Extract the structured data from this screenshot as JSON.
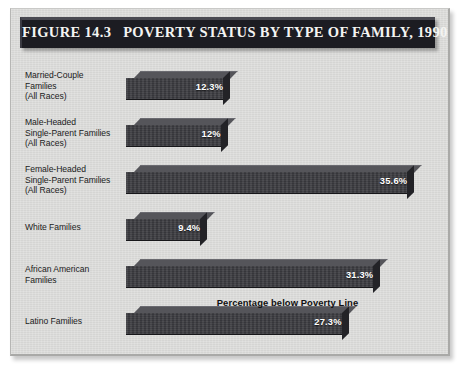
{
  "figure": {
    "title": "FIGURE 14.3   POVERTY STATUS BY TYPE OF FAMILY, 1990",
    "axis_caption": "Percentage below Poverty Line",
    "frame_background": "#d9d9d7",
    "title_band_color": "#1c1c22",
    "bar_front_color": "#3c3c41",
    "bar_top_color": "#55555a",
    "bar_side_color": "#232327",
    "value_label_color": "#ffffff"
  },
  "chart_data": {
    "type": "bar",
    "orientation": "horizontal",
    "title": "FIGURE 14.3   POVERTY STATUS BY TYPE OF FAMILY, 1990",
    "xlabel": "Percentage below Poverty Line",
    "ylabel": "",
    "xlim": [
      0,
      40
    ],
    "grid": false,
    "legend": "none",
    "categories": [
      "Married-Couple Families (All Races)",
      "Male-Headed Single-Parent Families (All Races)",
      "Female-Headed Single-Parent Families (All Races)",
      "White Families",
      "African American Families",
      "Latino Families"
    ],
    "values": [
      12.3,
      12.0,
      35.6,
      9.4,
      31.3,
      27.3
    ],
    "value_labels": [
      "12.3%",
      "12%",
      "35.6%",
      "9.4%",
      "31.3%",
      "27.3%"
    ]
  },
  "rows": [
    {
      "label_lines": [
        "Married-Couple",
        "Families",
        "(All Races)"
      ],
      "value": 12.3,
      "value_label": "12.3%"
    },
    {
      "label_lines": [
        "Male-Headed",
        "Single-Parent Families",
        "(All Races)"
      ],
      "value": 12.0,
      "value_label": "12%"
    },
    {
      "label_lines": [
        "Female-Headed",
        "Single-Parent Families",
        "(All Races)"
      ],
      "value": 35.6,
      "value_label": "35.6%"
    },
    {
      "label_lines": [
        "White Families"
      ],
      "value": 9.4,
      "value_label": "9.4%"
    },
    {
      "label_lines": [
        "African American",
        "Families"
      ],
      "value": 31.3,
      "value_label": "31.3%"
    },
    {
      "label_lines": [
        "Latino Families"
      ],
      "value": 27.3,
      "value_label": "27.3%"
    }
  ]
}
